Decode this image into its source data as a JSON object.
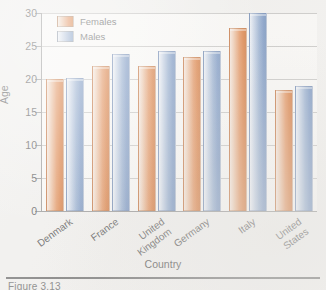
{
  "chart_data": {
    "type": "bar",
    "title": "",
    "subtitle": "",
    "xlabel": "Country",
    "ylabel": "Age",
    "categories": [
      "Denmark",
      "France",
      "United Kingdom",
      "Germany",
      "Italy",
      "United States"
    ],
    "series": [
      {
        "name": "Females",
        "color": "#e0834a",
        "values": [
          20.0,
          22.0,
          22.0,
          23.3,
          27.7,
          18.4
        ]
      },
      {
        "name": "Males",
        "color": "#8ca7cd",
        "values": [
          20.1,
          23.8,
          24.2,
          24.2,
          30.0,
          18.9
        ]
      }
    ],
    "ylim": [
      0,
      30
    ],
    "yticks": [
      0,
      5,
      10,
      15,
      20,
      25,
      30
    ],
    "ytick_labels": [
      "0",
      "5",
      "10",
      "15",
      "20",
      "25",
      "30"
    ],
    "grid": true,
    "grid_axis": "y",
    "legend_position": "upper left",
    "bar_style": "gradient-fill",
    "xtick_rotation": -36
  },
  "legend": {
    "entries": [
      {
        "label": "Females",
        "swatch": "female"
      },
      {
        "label": "Males",
        "swatch": "male"
      }
    ]
  },
  "axes": {
    "y_title": "Age",
    "x_title": "Country"
  },
  "caption": {
    "clipped_text": "Figure 3.13"
  }
}
